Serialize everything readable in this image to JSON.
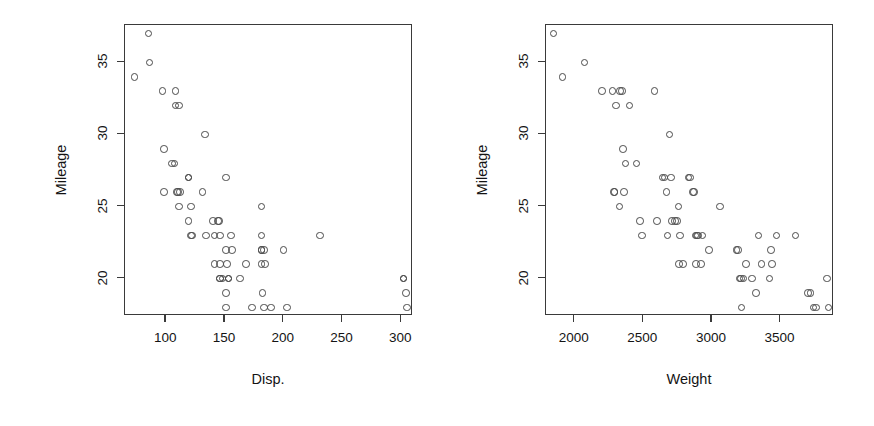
{
  "figure": {
    "background": "#ffffff",
    "point_color": "#4a4a4a",
    "axis_color": "#3a3a3a",
    "text_color": "#141414",
    "panel_count": 2
  },
  "chart_data": [
    {
      "type": "scatter",
      "title": "",
      "xlabel": "Disp.",
      "ylabel": "Mileage",
      "xlim": [
        65,
        310
      ],
      "ylim": [
        17.4,
        37.6
      ],
      "xticks": [
        100,
        150,
        200,
        250,
        300
      ],
      "yticks": [
        20,
        25,
        30,
        35
      ],
      "grid": false,
      "legend": "none",
      "marker": "open-circle",
      "x": [
        73,
        85,
        86,
        97,
        98,
        98,
        105,
        107,
        108,
        108,
        109,
        110,
        111,
        111,
        112,
        119,
        119,
        119,
        121,
        121,
        122,
        131,
        133,
        134,
        140,
        141,
        141,
        144,
        145,
        146,
        146,
        146,
        146,
        148,
        151,
        151,
        151,
        151,
        152,
        153,
        153,
        155,
        156,
        163,
        168,
        173,
        181,
        181,
        181,
        181,
        181,
        182,
        183,
        183,
        184,
        189,
        200,
        203,
        231,
        302,
        302,
        304,
        305
      ],
      "y": [
        34,
        37,
        35,
        33,
        29,
        26,
        28,
        28,
        33,
        32,
        26,
        26,
        25,
        32,
        26,
        27,
        27,
        24,
        25,
        23,
        23,
        26,
        30,
        23,
        24,
        23,
        21,
        24,
        24,
        23,
        21,
        20,
        20,
        20,
        27,
        22,
        19,
        18,
        21,
        20,
        20,
        23,
        22,
        20,
        21,
        18,
        25,
        23,
        22,
        22,
        21,
        19,
        22,
        18,
        21,
        18,
        22,
        18,
        23,
        20,
        20,
        19,
        18
      ]
    },
    {
      "type": "scatter",
      "title": "",
      "xlabel": "Weight",
      "ylabel": "Mileage",
      "xlim": [
        1790,
        3890
      ],
      "ylim": [
        17.4,
        37.6
      ],
      "xticks": [
        2000,
        2500,
        3000,
        3500
      ],
      "yticks": [
        20,
        25,
        30,
        35
      ],
      "grid": false,
      "legend": "none",
      "marker": "open-circle",
      "x": [
        1845,
        1910,
        2070,
        2200,
        2275,
        2285,
        2290,
        2300,
        2325,
        2330,
        2345,
        2350,
        2360,
        2370,
        2400,
        2450,
        2475,
        2490,
        2580,
        2600,
        2640,
        2655,
        2670,
        2675,
        2690,
        2700,
        2710,
        2730,
        2745,
        2755,
        2760,
        2765,
        2790,
        2830,
        2840,
        2860,
        2870,
        2880,
        2885,
        2890,
        2900,
        2920,
        2930,
        2980,
        3060,
        3180,
        3190,
        3200,
        3210,
        3215,
        3230,
        3250,
        3290,
        3320,
        3340,
        3360,
        3420,
        3430,
        3440,
        3470,
        3610,
        3700,
        3720,
        3740,
        3760,
        3840,
        3850
      ],
      "y": [
        37,
        34,
        35,
        33,
        33,
        26,
        26,
        32,
        25,
        33,
        33,
        29,
        26,
        28,
        32,
        28,
        24,
        23,
        33,
        24,
        27,
        27,
        26,
        23,
        30,
        27,
        24,
        24,
        24,
        25,
        21,
        23,
        21,
        27,
        27,
        26,
        26,
        23,
        21,
        23,
        23,
        21,
        23,
        22,
        25,
        22,
        22,
        20,
        20,
        18,
        20,
        21,
        20,
        19,
        23,
        21,
        20,
        22,
        21,
        23,
        23,
        19,
        19,
        18,
        18,
        20,
        18
      ]
    }
  ],
  "panels": [
    {
      "id": "disp",
      "x_axis_title": "Disp.",
      "y_axis_title": "Mileage",
      "x_tick_labels": [
        "100",
        "150",
        "200",
        "250",
        "300"
      ],
      "y_tick_labels": [
        "20",
        "25",
        "30",
        "35"
      ]
    },
    {
      "id": "weight",
      "x_axis_title": "Weight",
      "y_axis_title": "Mileage",
      "x_tick_labels": [
        "2000",
        "2500",
        "3000",
        "3500"
      ],
      "y_tick_labels": [
        "20",
        "25",
        "30",
        "35"
      ]
    }
  ]
}
